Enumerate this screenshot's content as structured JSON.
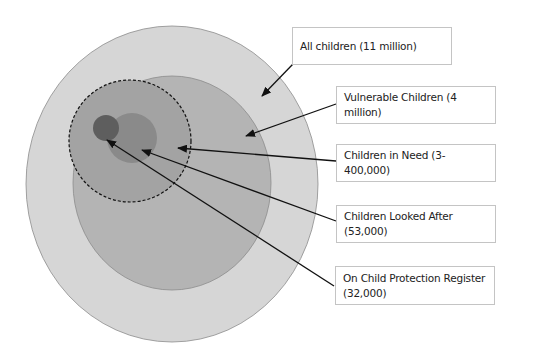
{
  "diagram": {
    "labels": [
      {
        "id": "all",
        "text": "All children (11 million)"
      },
      {
        "id": "vulnerable",
        "text": "Vulnerable Children (4 million)"
      },
      {
        "id": "in_need",
        "text": "Children in Need (3-400,000)"
      },
      {
        "id": "looked_after",
        "text": "Children Looked After (53,000)"
      },
      {
        "id": "protection",
        "text": "On Child Protection Register (32,000)"
      }
    ],
    "colors": {
      "all_children": "#d6d6d6",
      "vulnerable": "#b4b4b4",
      "in_need": "#a3a3a3",
      "looked_after": "#8a8a8a",
      "protection": "#5e5e5e",
      "outline": "#8c8c8c",
      "arrow": "#111111",
      "box_border": "#c4c4c4"
    }
  }
}
